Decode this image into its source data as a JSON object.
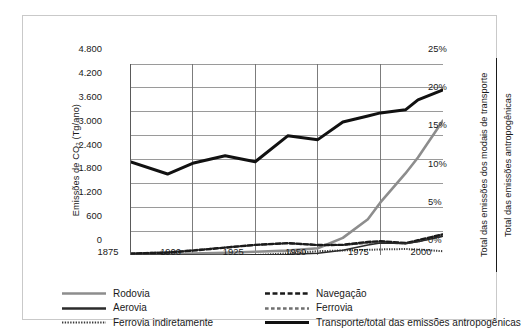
{
  "chart_data": {
    "type": "line",
    "title": "",
    "xlabel": "",
    "ylabel": "Emissões de CO₂ (Tg/ano)",
    "y2label_numerator": "Total das emissões dos modais de transporte",
    "y2label_denominator": "Total das emissões antropogênicas",
    "x": [
      1875,
      1890,
      1900,
      1913,
      1925,
      1938,
      1950,
      1960,
      1970,
      1975,
      1985,
      1990,
      2000
    ],
    "xlim": [
      1875,
      2000
    ],
    "xticks": [
      1875,
      1900,
      1925,
      1950,
      1975,
      2000
    ],
    "xtick_labels": [
      "1875",
      "1900",
      "1925",
      "1950",
      "1975",
      "2000"
    ],
    "ylim": [
      0,
      4800
    ],
    "yticks": [
      0,
      600,
      1200,
      1800,
      2400,
      3000,
      3600,
      4200,
      4800
    ],
    "ytick_labels": [
      "0",
      "600",
      "1.200",
      "1.800",
      "2.400",
      "3.000",
      "3.600",
      "4.200",
      "4.800"
    ],
    "y2lim": [
      0,
      25
    ],
    "y2ticks": [
      0,
      5,
      10,
      15,
      20,
      25
    ],
    "y2tick_labels": [
      "0%",
      "5%",
      "10%",
      "15%",
      "20%",
      "25%"
    ],
    "grid": true,
    "legend_position": "below",
    "series": [
      {
        "name": "Rodovia",
        "axis": "left",
        "style": "solid",
        "color": "#8d8d8d",
        "width": 2.6,
        "x": [
          1875,
          1890,
          1900,
          1913,
          1925,
          1938,
          1950,
          1960,
          1970,
          1975,
          1985,
          1990,
          2000
        ],
        "values": [
          20,
          25,
          35,
          55,
          80,
          110,
          170,
          430,
          900,
          1320,
          2050,
          2450,
          3380
        ]
      },
      {
        "name": "Aerovia",
        "axis": "left",
        "style": "solid",
        "color": "#2b2b2b",
        "width": 1.5,
        "x": [
          1875,
          1890,
          1900,
          1913,
          1925,
          1938,
          1950,
          1960,
          1970,
          1975,
          1985,
          1990,
          2000
        ],
        "values": [
          0,
          0,
          0,
          0,
          5,
          15,
          45,
          120,
          250,
          300,
          290,
          330,
          470
        ]
      },
      {
        "name": "Navegação",
        "axis": "left",
        "style": "dashed",
        "color": "#1a1a1a",
        "width": 2.4,
        "x": [
          1875,
          1890,
          1900,
          1913,
          1925,
          1938,
          1950,
          1960,
          1970,
          1975,
          1985,
          1990,
          2000
        ],
        "values": [
          35,
          60,
          110,
          185,
          255,
          300,
          250,
          255,
          330,
          345,
          300,
          370,
          520
        ]
      },
      {
        "name": "Ferrovia",
        "axis": "left",
        "style": "dashed-short",
        "color": "#707070",
        "width": 2.0,
        "x": [
          1875,
          1890,
          1900,
          1913,
          1925,
          1938,
          1950,
          1960,
          1970,
          1975,
          1985,
          1990,
          2000
        ],
        "values": [
          40,
          70,
          120,
          190,
          250,
          290,
          250,
          250,
          300,
          320,
          285,
          340,
          480
        ]
      },
      {
        "name": "Ferrovia indiretamente",
        "axis": "left",
        "style": "dotted",
        "color": "#3a3a3a",
        "width": 2.0,
        "x": [
          1925,
          1938,
          1950,
          1960,
          1970,
          1975,
          1985,
          1990,
          2000
        ],
        "values": [
          0,
          40,
          95,
          115,
          130,
          140,
          150,
          140,
          95
        ]
      },
      {
        "name": "Transporte/total das emissões antropogênicas",
        "axis": "right",
        "style": "solid",
        "color": "#111111",
        "width": 3.0,
        "x": [
          1875,
          1890,
          1900,
          1913,
          1925,
          1938,
          1950,
          1960,
          1970,
          1975,
          1985,
          1990,
          2000
        ],
        "values": [
          12.2,
          10.6,
          12.0,
          13.0,
          12.2,
          15.6,
          15.1,
          17.4,
          18.2,
          18.6,
          19.0,
          20.3,
          21.6
        ]
      }
    ]
  },
  "legend": {
    "entries": [
      {
        "label": "Rodovia",
        "style": "solid",
        "color": "#8d8d8d",
        "width": 2.6
      },
      {
        "label": "Navegação",
        "style": "dashed",
        "color": "#1a1a1a",
        "width": 2.6
      },
      {
        "label": "Aerovia",
        "style": "solid",
        "color": "#2b2b2b",
        "width": 2.6
      },
      {
        "label": "Ferrovia",
        "style": "dashed-short",
        "color": "#707070",
        "width": 2.4
      },
      {
        "label": "Ferrovia indiretamente",
        "style": "dotted",
        "color": "#3a3a3a",
        "width": 2.2
      },
      {
        "label": "Transporte/total das emissões antropogênicas",
        "style": "solid",
        "color": "#111111",
        "width": 2.8
      }
    ]
  }
}
